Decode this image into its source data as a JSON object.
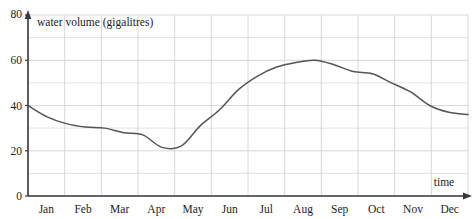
{
  "chart_data": {
    "type": "line",
    "title": "",
    "xlabel": "time",
    "ylabel": "water volume (gigalitres)",
    "ylim": [
      0,
      80
    ],
    "ytick_values": [
      0,
      20,
      40,
      60,
      80
    ],
    "ytick_labels": [
      "0",
      "20",
      "40",
      "60",
      "80"
    ],
    "yminor_step": 10,
    "grid": true,
    "legend": "none",
    "categories": [
      "Jan",
      "Feb",
      "Mar",
      "Apr",
      "May",
      "Jun",
      "Jul",
      "Aug",
      "Sep",
      "Oct",
      "Nov",
      "Dec"
    ],
    "series": [
      {
        "name": "water volume",
        "color": "#555555",
        "values": [
          40,
          32,
          30,
          27,
          22,
          31,
          53,
          59,
          60,
          55,
          46,
          37
        ]
      }
    ],
    "points": [
      {
        "x": "Jan",
        "value": 40
      },
      {
        "x": "Jan-Feb",
        "value": 35
      },
      {
        "x": "Feb",
        "value": 32
      },
      {
        "x": "Feb-Mar",
        "value": 30.5
      },
      {
        "x": "Mar",
        "value": 30
      },
      {
        "x": "Mar-Apr",
        "value": 28
      },
      {
        "x": "Apr",
        "value": 27
      },
      {
        "x": "Apr-May",
        "value": 21.5
      },
      {
        "x": "May",
        "value": 22
      },
      {
        "x": "May-Jun",
        "value": 31
      },
      {
        "x": "Jun",
        "value": 38
      },
      {
        "x": "Jun-Jul",
        "value": 47
      },
      {
        "x": "Jul",
        "value": 53
      },
      {
        "x": "Jul-Aug",
        "value": 57
      },
      {
        "x": "Aug",
        "value": 59
      },
      {
        "x": "Aug-Sep",
        "value": 60
      },
      {
        "x": "Sep",
        "value": 58
      },
      {
        "x": "Sep-Oct",
        "value": 55
      },
      {
        "x": "Oct",
        "value": 54
      },
      {
        "x": "Oct-Nov",
        "value": 50
      },
      {
        "x": "Nov",
        "value": 46
      },
      {
        "x": "Nov-Dec",
        "value": 40
      },
      {
        "x": "Dec",
        "value": 37
      },
      {
        "x": "Dec-end",
        "value": 36
      }
    ],
    "annotations": {
      "y_axis_caption": "water volume (gigalitres)",
      "x_axis_caption": "time"
    },
    "colors": {
      "line": "#555555",
      "grid": "#d8d8d8",
      "axis": "#3a3a3a",
      "background": "#ffffff",
      "text": "#1d1d1d"
    }
  }
}
